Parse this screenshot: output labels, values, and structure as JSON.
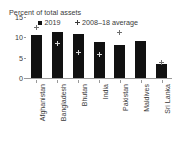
{
  "chart_data": {
    "type": "bar",
    "title": "Percent of total assets",
    "xlabel": "",
    "ylabel": "Percent of total assets",
    "ylim": [
      0,
      15
    ],
    "yticks": [
      0,
      5,
      10,
      15
    ],
    "ytick_labels": [
      "0",
      "5",
      "10",
      "15"
    ],
    "grid": false,
    "legend_position": "top",
    "categories": [
      "Afghanistan",
      "Bangladesh",
      "Bhutan",
      "India",
      "Pakistan",
      "Maldives",
      "Sri Lanka"
    ],
    "series": [
      {
        "name": "2019",
        "marker": "square",
        "color": "#111111",
        "values": [
          10.6,
          11.2,
          10.8,
          8.8,
          8.0,
          9.2,
          3.5
        ]
      },
      {
        "name": "2008–18 average",
        "marker": "cross",
        "color": "#6e6e6e",
        "values": [
          12.4,
          8.6,
          6.3,
          5.7,
          11.3,
          null,
          3.7
        ]
      }
    ]
  },
  "legend": {
    "entries": [
      {
        "label": "2019",
        "icon": "square-marker-icon"
      },
      {
        "label": "2008–18 average",
        "icon": "cross-marker-icon"
      }
    ]
  }
}
